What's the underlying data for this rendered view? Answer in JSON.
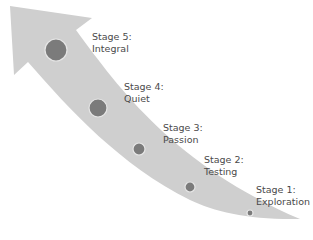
{
  "diagram": {
    "type": "growth-arrow",
    "colors": {
      "arrow": "#cfcfcf",
      "circle_fill": "#7b7b7b",
      "circle_stroke": "#e6e6e6",
      "text": "#4a4a4a"
    },
    "stages": [
      {
        "number": 5,
        "title": "Stage 5:",
        "name": "Integral"
      },
      {
        "number": 4,
        "title": "Stage 4:",
        "name": "Quiet"
      },
      {
        "number": 3,
        "title": "Stage 3:",
        "name": "Passion"
      },
      {
        "number": 2,
        "title": "Stage 2:",
        "name": "Testing"
      },
      {
        "number": 1,
        "title": "Stage 1:",
        "name": "Exploration"
      }
    ]
  }
}
